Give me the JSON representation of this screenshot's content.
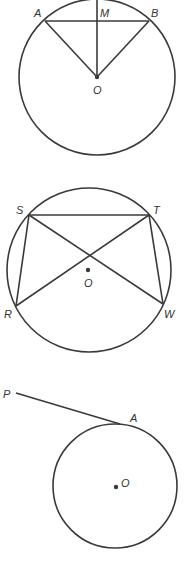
{
  "figures": [
    {
      "name": "chord-midpoint-figure",
      "labels": {
        "A": "A",
        "M": "M",
        "B": "B",
        "O": "O"
      }
    },
    {
      "name": "inscribed-quadrilateral-figure",
      "labels": {
        "S": "S",
        "T": "T",
        "R": "R",
        "W": "W",
        "O": "O"
      }
    },
    {
      "name": "tangent-figure",
      "labels": {
        "P": "P",
        "A": "A",
        "O": "O"
      }
    }
  ],
  "colors": {
    "line": "#3a3a3a",
    "text": "#333333",
    "background": "#ffffff"
  }
}
